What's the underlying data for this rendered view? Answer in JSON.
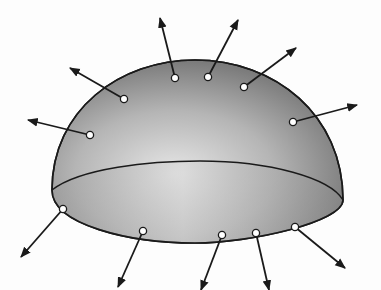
{
  "diagram": {
    "colors": {
      "background": "#fdfdfd",
      "outline": "#1a1a1a",
      "shade_light": "#e6e6e6",
      "shade_mid": "#b5b5b5",
      "shade_dark": "#7a7a7a",
      "point_fill": "#ffffff"
    },
    "dome": {
      "left": [
        52,
        190
      ],
      "right": [
        343,
        200
      ],
      "apex": [
        195,
        60
      ]
    },
    "base_ellipse": {
      "back_arc_top_y": 161,
      "front_arc_bottom_y": 243
    },
    "top_vectors": [
      {
        "point": [
          90,
          135
        ],
        "tip": [
          28,
          120
        ]
      },
      {
        "point": [
          124,
          99
        ],
        "tip": [
          70,
          68
        ]
      },
      {
        "point": [
          175,
          78
        ],
        "tip": [
          160,
          18
        ]
      },
      {
        "point": [
          208,
          77
        ],
        "tip": [
          238,
          20
        ]
      },
      {
        "point": [
          244,
          87
        ],
        "tip": [
          296,
          48
        ]
      },
      {
        "point": [
          293,
          122
        ],
        "tip": [
          357,
          105
        ]
      }
    ],
    "bottom_vectors": [
      {
        "point": [
          63,
          209
        ],
        "tip": [
          21,
          257
        ]
      },
      {
        "point": [
          143,
          231
        ],
        "tip": [
          118,
          287
        ]
      },
      {
        "point": [
          222,
          235
        ],
        "tip": [
          201,
          290
        ]
      },
      {
        "point": [
          256,
          233
        ],
        "tip": [
          269,
          290
        ]
      },
      {
        "point": [
          295,
          227
        ],
        "tip": [
          345,
          268
        ]
      }
    ]
  }
}
